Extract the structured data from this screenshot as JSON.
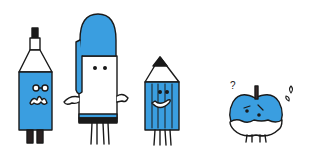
{
  "illustration": {
    "description": "Hand-drawn cartoon characters: a marker, a capped pen, a pencil, and a worried apple",
    "colors": {
      "blue": "#3a9ee0",
      "outline": "#1a1a1a",
      "white": "#ffffff",
      "dark": "#2a2222"
    },
    "characters": [
      {
        "id": "marker",
        "label": "Marker character with glasses and mustache"
      },
      {
        "id": "pen",
        "label": "Pen character with blue cap"
      },
      {
        "id": "pencil",
        "label": "Smiling pencil character"
      },
      {
        "id": "apple",
        "label": "Worried blue apple with question mark and sweat drops"
      }
    ],
    "annotations": {
      "question_mark": "?"
    }
  }
}
